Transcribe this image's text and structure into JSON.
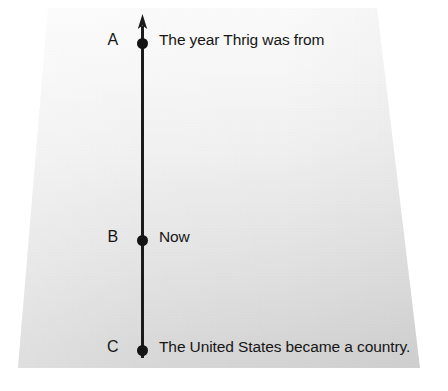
{
  "document": {
    "type": "timeline-diagram",
    "medium": "photographed worksheet page"
  },
  "colors": {
    "ink": "#161616",
    "paper_top": "#fbfbfb",
    "paper_bottom": "#d2d2d2",
    "page_background": "#ffffff"
  },
  "timeline": {
    "axis": {
      "orientation": "vertical",
      "arrow_direction": "up",
      "arrow_at": "top"
    },
    "points": [
      {
        "letter": "A",
        "label": "The year Thrig was from",
        "position": "top"
      },
      {
        "letter": "B",
        "label": "Now",
        "position": "middle"
      },
      {
        "letter": "C",
        "label": "The United States became a country.",
        "position": "bottom"
      }
    ]
  }
}
